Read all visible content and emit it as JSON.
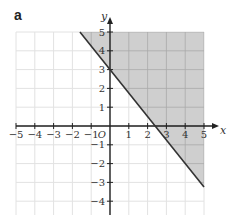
{
  "part_label": "a",
  "chart_data": {
    "type": "line",
    "title": "",
    "xlabel": "x",
    "ylabel": "y",
    "origin_label": "O",
    "xlim": [
      -5,
      5
    ],
    "ylim": [
      -5,
      5
    ],
    "grid": true,
    "x_ticks": [
      -5,
      -4,
      -3,
      -2,
      -1,
      1,
      2,
      3,
      4,
      5
    ],
    "y_ticks": [
      -4,
      -3,
      -2,
      -1,
      1,
      2,
      3,
      4,
      5
    ],
    "series": [
      {
        "name": "boundary line",
        "equation": "5x + 4y = 12",
        "x": [
          -1.6,
          5
        ],
        "y": [
          5,
          -3.25
        ],
        "style": "solid"
      }
    ],
    "shaded_region": {
      "description": "region above/right of the line, within x ≤ 5 and y ≤ 5",
      "inequality": "5x + 4y ≥ 12",
      "polygon": [
        [
          -1.6,
          5
        ],
        [
          5,
          5
        ],
        [
          5,
          -3.25
        ]
      ]
    },
    "annotations": []
  },
  "colors": {
    "shade": "#cfcfcf",
    "grid_light": "#e2e2e2",
    "grid_dark": "#a9a9a9",
    "axis": "#222222",
    "line": "#333333"
  }
}
